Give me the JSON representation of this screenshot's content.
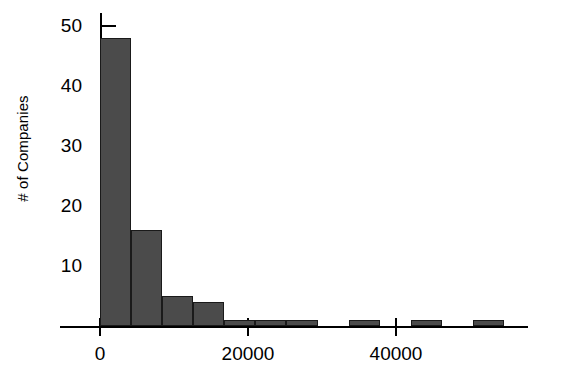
{
  "chart_data": {
    "type": "bar",
    "title": "",
    "subtitle": "",
    "xlabel": "",
    "ylabel": "# of Companies",
    "grid": false,
    "legend": false,
    "bin_width": 4200,
    "bin_starts": [
      0,
      4200,
      8400,
      12600,
      16800,
      21000,
      25200,
      29400,
      33600,
      37800,
      42000,
      46200,
      50400
    ],
    "categories": [
      "0-4200",
      "4200-8400",
      "8400-12600",
      "12600-16800",
      "16800-21000",
      "21000-25200",
      "25200-29400",
      "29400-33600",
      "33600-37800",
      "37800-42000",
      "42000-46200",
      "46200-50400",
      "50400-54600"
    ],
    "values": [
      48,
      16,
      5,
      4,
      1,
      1,
      1,
      0,
      1,
      0,
      1,
      0,
      1
    ],
    "xlim": [
      -3000,
      58000
    ],
    "ylim": [
      0,
      52
    ],
    "yticks": [
      10,
      20,
      30,
      40,
      50
    ],
    "ytick_labels": [
      "10",
      "20",
      "30",
      "40",
      "50"
    ],
    "xticks": [
      0,
      20000,
      40000
    ],
    "xtick_labels": [
      "0",
      "20000",
      "40000"
    ],
    "bar_color": "#4b4b4b",
    "bar_edge_color": "#1a1a1a",
    "axis_color": "#000000",
    "background_color": "#ffffff"
  }
}
